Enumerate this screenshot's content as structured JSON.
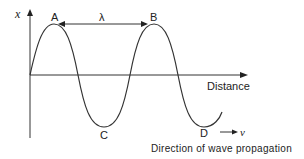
{
  "diagram": {
    "axis_y_label": "x",
    "axis_x_label": "Distance",
    "points": {
      "A": "A",
      "B": "B",
      "C": "C",
      "D": "D"
    },
    "wavelength_label": "λ",
    "velocity_label": "v",
    "caption": "Direction of wave propagation",
    "line_color": "#333333"
  }
}
